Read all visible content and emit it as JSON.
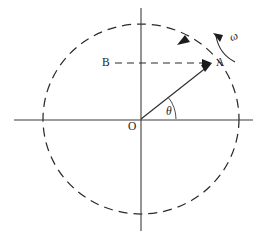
{
  "figure": {
    "kind": "circular-motion-diagram",
    "labels": {
      "origin": "O",
      "point_a": "A",
      "point_b": "B",
      "angle": "θ",
      "angular_velocity": "ω"
    },
    "geometry": {
      "center": {
        "x": 141,
        "y": 119
      },
      "radius_x": 98,
      "radius_y": 95,
      "point_a": {
        "x": 212,
        "y": 63
      },
      "point_b": {
        "x": 115,
        "y": 63
      },
      "theta_degrees": 38,
      "x_axis": {
        "x1": 14,
        "y1": 120,
        "x2": 253,
        "y2": 120
      },
      "y_axis": {
        "x1": 141,
        "y1": 8,
        "x2": 141,
        "y2": 231
      },
      "rotation_direction": "counterclockwise"
    },
    "colors": {
      "ink": "#1c1c1c",
      "line": "#2b2b2b",
      "axis": "#3d3d3d",
      "background": "#ffffff"
    }
  }
}
